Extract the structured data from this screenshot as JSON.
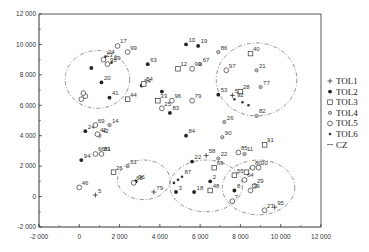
{
  "chart_data": {
    "type": "scatter",
    "title": "",
    "xlabel": "",
    "ylabel": "",
    "xlim": [
      -2000,
      12000
    ],
    "ylim": [
      -2000,
      12000
    ],
    "x_ticks": [
      -2000,
      0,
      2000,
      4000,
      6000,
      8000,
      10000,
      12000
    ],
    "y_ticks": [
      -2000,
      0,
      2000,
      4000,
      6000,
      8000,
      10000,
      12000
    ],
    "x_tick_labels": [
      "-2 000",
      "0",
      "2 000",
      "4 000",
      "6 000",
      "8 000",
      "10 000",
      "12 000"
    ],
    "y_tick_labels": [
      "-2 000",
      "0",
      "2 000",
      "4 000",
      "6 000",
      "8 000",
      "10 000",
      "12 000"
    ],
    "grid": false,
    "legend_position": "right",
    "legend": [
      "TOL1",
      "TOL2",
      "TOL3",
      "TOL4",
      "TOL5",
      "TOL6",
      "CZ"
    ],
    "series": [
      {
        "name": "TOL1",
        "marker": "plus",
        "points": [
          {
            "x": 800,
            "y": 100,
            "label": "5"
          },
          {
            "x": 9700,
            "y": -700,
            "label": "95"
          },
          {
            "x": 7600,
            "y": 6650,
            "label": "53"
          },
          {
            "x": 3700,
            "y": 300,
            "label": "79"
          },
          {
            "x": 6300,
            "y": 2700,
            "label": "58"
          }
        ]
      },
      {
        "name": "TOL2",
        "marker": "star",
        "points": [
          {
            "x": 300,
            "y": 4300,
            "label": "24"
          },
          {
            "x": 100,
            "y": 2400,
            "label": "94"
          },
          {
            "x": 1500,
            "y": 6500,
            "label": "41"
          },
          {
            "x": 1100,
            "y": 7500,
            "label": "20"
          },
          {
            "x": 600,
            "y": 8450,
            "label": ""
          },
          {
            "x": 3400,
            "y": 8700,
            "label": "63"
          },
          {
            "x": 3100,
            "y": 7300,
            "label": "54"
          },
          {
            "x": 4100,
            "y": 6900,
            "label": ""
          },
          {
            "x": 4500,
            "y": 5500,
            "label": "83"
          },
          {
            "x": 5300,
            "y": 4000,
            "label": "84"
          },
          {
            "x": 5600,
            "y": 2300,
            "label": "22"
          },
          {
            "x": 5300,
            "y": 10000,
            "label": "10"
          },
          {
            "x": 5900,
            "y": 9900,
            "label": "19"
          },
          {
            "x": 6900,
            "y": 6700,
            "label": "53"
          },
          {
            "x": 2800,
            "y": 1000,
            "label": "36"
          },
          {
            "x": 4800,
            "y": 300,
            "label": "3"
          },
          {
            "x": 5700,
            "y": 300,
            "label": "18"
          },
          {
            "x": 6500,
            "y": 1000,
            "label": "2"
          },
          {
            "x": 7700,
            "y": 400,
            "label": "8"
          }
        ]
      },
      {
        "name": "TOL3",
        "marker": "square",
        "points": [
          {
            "x": 4900,
            "y": 8400,
            "label": "12"
          },
          {
            "x": 3900,
            "y": 6300,
            "label": "33"
          },
          {
            "x": 3200,
            "y": 7400,
            "label": "54"
          },
          {
            "x": 2400,
            "y": 6400,
            "label": "44"
          },
          {
            "x": 8500,
            "y": 9400,
            "label": "40"
          },
          {
            "x": 8000,
            "y": 6900,
            "label": "28"
          },
          {
            "x": 1700,
            "y": 1600,
            "label": "26"
          },
          {
            "x": 6700,
            "y": 1900,
            "label": "69"
          },
          {
            "x": 6500,
            "y": 400,
            "label": "48"
          },
          {
            "x": 7700,
            "y": 1400,
            "label": "55"
          },
          {
            "x": 9200,
            "y": 3400,
            "label": "91"
          },
          {
            "x": 8300,
            "y": 1600,
            "label": "47"
          }
        ]
      },
      {
        "name": "TOL4",
        "marker": "diamond",
        "points": [
          {
            "x": 1500,
            "y": 4700,
            "label": "14"
          },
          {
            "x": 1000,
            "y": 4000,
            "label": "42"
          },
          {
            "x": 1100,
            "y": 2800,
            "label": "81"
          },
          {
            "x": 7200,
            "y": 4900,
            "label": "26"
          },
          {
            "x": 7100,
            "y": 3900,
            "label": "90"
          },
          {
            "x": 8200,
            "y": 2800,
            "label": "11"
          },
          {
            "x": 6900,
            "y": 2500,
            "label": "22"
          },
          {
            "x": 8800,
            "y": 8300,
            "label": "21"
          },
          {
            "x": 9000,
            "y": 7200,
            "label": "77"
          },
          {
            "x": 8800,
            "y": 5300,
            "label": "82"
          },
          {
            "x": 6000,
            "y": 8700,
            "label": "67"
          },
          {
            "x": 6900,
            "y": 9500,
            "label": "86"
          },
          {
            "x": 2400,
            "y": 2000,
            "label": "51"
          }
        ]
      },
      {
        "name": "TOL5",
        "marker": "circle",
        "points": [
          {
            "x": 1900,
            "y": 9900,
            "label": "17"
          },
          {
            "x": 1200,
            "y": 9000,
            "label": "13"
          },
          {
            "x": 1400,
            "y": 8700,
            "label": "95"
          },
          {
            "x": 800,
            "y": 4700,
            "label": "69"
          },
          {
            "x": 900,
            "y": 4100,
            "label": "42"
          },
          {
            "x": 800,
            "y": 2800,
            "label": "66"
          },
          {
            "x": 1100,
            "y": 2800,
            "label": "81"
          },
          {
            "x": 0,
            "y": 600,
            "label": "46"
          },
          {
            "x": 300,
            "y": 6600,
            "label": ""
          },
          {
            "x": 200,
            "y": 6800,
            "label": ""
          },
          {
            "x": 100,
            "y": 6400,
            "label": ""
          },
          {
            "x": 2400,
            "y": 9500,
            "label": "99"
          },
          {
            "x": 4600,
            "y": 6300,
            "label": "96"
          },
          {
            "x": 4100,
            "y": 5800,
            "label": "25"
          },
          {
            "x": 5600,
            "y": 8400,
            "label": "93"
          },
          {
            "x": 5600,
            "y": 6300,
            "label": "79"
          },
          {
            "x": 7300,
            "y": 8300,
            "label": "97"
          },
          {
            "x": 7900,
            "y": 2900,
            "label": "85"
          },
          {
            "x": 2700,
            "y": 900,
            "label": "68"
          },
          {
            "x": 8600,
            "y": 1900,
            "label": "80"
          },
          {
            "x": 8900,
            "y": 1900,
            "label": "30"
          },
          {
            "x": 8200,
            "y": 1100,
            "label": "64"
          },
          {
            "x": 8700,
            "y": 700,
            "label": "29"
          },
          {
            "x": 8500,
            "y": 400,
            "label": "39"
          },
          {
            "x": 7600,
            "y": -300,
            "label": "7"
          },
          {
            "x": 9200,
            "y": -900,
            "label": "27"
          }
        ]
      },
      {
        "name": "TOL6",
        "marker": "small-star",
        "points": [
          {
            "x": 1300,
            "y": 9200,
            "label": "24"
          },
          {
            "x": 1600,
            "y": 8800,
            "label": "59"
          },
          {
            "x": 5100,
            "y": 1300,
            "label": "87"
          },
          {
            "x": 4900,
            "y": 1100,
            "label": ""
          },
          {
            "x": 4700,
            "y": 900,
            "label": ""
          },
          {
            "x": 7700,
            "y": 6400,
            "label": "92"
          },
          {
            "x": 8100,
            "y": 6200,
            "label": ""
          },
          {
            "x": 8400,
            "y": 6000,
            "label": ""
          }
        ]
      }
    ],
    "annotations": [
      {
        "type": "ellipse",
        "series": "CZ",
        "style": "dash-dot",
        "cx": 900,
        "cy": 7700,
        "rx": 1600,
        "ry": 1900
      },
      {
        "type": "ellipse",
        "series": "CZ",
        "style": "dash-dot",
        "cx": 8800,
        "cy": 7700,
        "rx": 2000,
        "ry": 2400
      },
      {
        "type": "ellipse",
        "series": "CZ",
        "style": "dash-dot",
        "cx": 8900,
        "cy": 600,
        "rx": 1800,
        "ry": 1800
      },
      {
        "type": "ellipse",
        "series": "CZ",
        "style": "dash-dot",
        "cx": 6300,
        "cy": 700,
        "rx": 1800,
        "ry": 1700
      },
      {
        "type": "ellipse",
        "series": "CZ",
        "style": "dash-dot",
        "cx": 3200,
        "cy": 1100,
        "rx": 1300,
        "ry": 1300
      }
    ]
  }
}
